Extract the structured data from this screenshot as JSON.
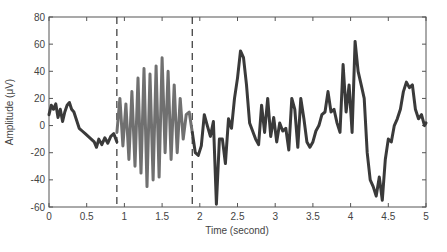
{
  "chart_data": {
    "type": "line",
    "title": "",
    "xlabel": "Time (second)",
    "ylabel": "Amplitude (μV)",
    "xlim": [
      0,
      5
    ],
    "ylim": [
      -60,
      80
    ],
    "xticks": [
      0,
      0.5,
      1,
      1.5,
      2,
      2.5,
      3,
      3.5,
      4,
      4.5,
      5
    ],
    "xtick_labels": [
      "0",
      "0.5",
      "1",
      "1.5",
      "2",
      "2.5",
      "3",
      "3.5",
      "4",
      "4.5",
      "5"
    ],
    "yticks": [
      -60,
      -40,
      -20,
      0,
      20,
      40,
      60,
      80
    ],
    "ytick_labels": [
      "-60",
      "-40",
      "-20",
      "0",
      "20",
      "40",
      "60",
      "80"
    ],
    "grid": false,
    "legend": null,
    "annotations": [
      {
        "type": "vline",
        "style": "dashed",
        "x": 0.9
      },
      {
        "type": "vline",
        "style": "dashed",
        "x": 1.9
      }
    ],
    "series": [
      {
        "name": "pre-stimulus",
        "color": "#3a3a3a",
        "x": [
          0,
          0.03,
          0.06,
          0.09,
          0.12,
          0.15,
          0.18,
          0.21,
          0.24,
          0.27,
          0.3,
          0.33,
          0.36,
          0.4,
          0.44,
          0.48,
          0.52,
          0.56,
          0.6,
          0.63,
          0.66,
          0.7,
          0.74,
          0.78,
          0.82,
          0.86,
          0.9
        ],
        "y": [
          8,
          15,
          12,
          16,
          6,
          12,
          3,
          10,
          15,
          17,
          12,
          10,
          5,
          -2,
          -4,
          -6,
          -8,
          -10,
          -12,
          -16,
          -10,
          -14,
          -9,
          -13,
          -8,
          -6,
          -12
        ]
      },
      {
        "name": "oscillation",
        "color": "#707070",
        "x": [
          0.9,
          0.94,
          0.98,
          1.02,
          1.06,
          1.1,
          1.14,
          1.18,
          1.22,
          1.26,
          1.3,
          1.34,
          1.38,
          1.42,
          1.46,
          1.5,
          1.54,
          1.58,
          1.62,
          1.66,
          1.7,
          1.74,
          1.78,
          1.82,
          1.86,
          1.9
        ],
        "y": [
          -5,
          20,
          -15,
          16,
          -25,
          25,
          -30,
          35,
          -35,
          42,
          -45,
          38,
          -40,
          44,
          -38,
          50,
          -20,
          40,
          -25,
          30,
          -20,
          20,
          -10,
          8,
          10,
          -5
        ],
        "fill_between_dashed": true
      },
      {
        "name": "post-stimulus",
        "color": "#3a3a3a",
        "x": [
          1.9,
          1.94,
          1.98,
          2.02,
          2.06,
          2.1,
          2.14,
          2.18,
          2.22,
          2.26,
          2.3,
          2.34,
          2.38,
          2.42,
          2.46,
          2.5,
          2.54,
          2.58,
          2.62,
          2.66,
          2.7,
          2.74,
          2.78,
          2.82,
          2.86,
          2.9,
          2.94,
          2.98,
          3.02,
          3.06,
          3.1,
          3.14,
          3.18,
          3.22,
          3.26,
          3.3,
          3.34,
          3.38,
          3.42,
          3.46,
          3.5,
          3.54,
          3.58,
          3.62,
          3.66,
          3.7,
          3.74,
          3.78,
          3.82,
          3.86,
          3.9,
          3.94,
          3.98,
          4.02,
          4.06,
          4.1,
          4.14,
          4.18,
          4.22,
          4.26,
          4.3,
          4.34,
          4.38,
          4.42,
          4.46,
          4.5,
          4.54,
          4.58,
          4.62,
          4.66,
          4.7,
          4.74,
          4.78,
          4.82,
          4.86,
          4.9,
          4.94,
          4.98,
          5.0
        ],
        "y": [
          -5,
          -20,
          -22,
          -15,
          8,
          0,
          -8,
          3,
          -58,
          -10,
          -10,
          -28,
          5,
          -2,
          20,
          35,
          55,
          50,
          30,
          2,
          -4,
          -10,
          -14,
          15,
          -5,
          20,
          -8,
          6,
          -12,
          2,
          -4,
          -2,
          -18,
          20,
          12,
          -16,
          20,
          5,
          -12,
          -16,
          -12,
          -4,
          0,
          8,
          10,
          25,
          10,
          12,
          2,
          -5,
          45,
          10,
          30,
          -5,
          62,
          40,
          30,
          20,
          -20,
          -40,
          -45,
          -52,
          -38,
          -55,
          -25,
          -10,
          -12,
          0,
          5,
          12,
          25,
          32,
          28,
          30,
          12,
          5,
          8,
          0,
          2
        ]
      }
    ]
  }
}
